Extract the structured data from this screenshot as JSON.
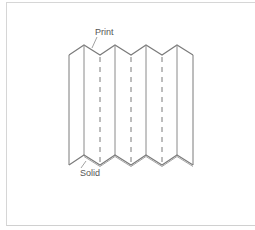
{
  "diagram": {
    "type": "accordion-fold",
    "labels": {
      "print": "Print",
      "solid": "Solid"
    },
    "panels": 8,
    "fold_lines": {
      "solid_x": [
        69,
        84,
        115,
        146,
        177,
        193
      ],
      "dashed_x": [
        100,
        131,
        162
      ]
    },
    "colors": {
      "line": "#7a7a7a",
      "shadow": "#9a9a9a",
      "label": "#555555",
      "frame": "#d6d6d6",
      "background": "#ffffff"
    }
  }
}
